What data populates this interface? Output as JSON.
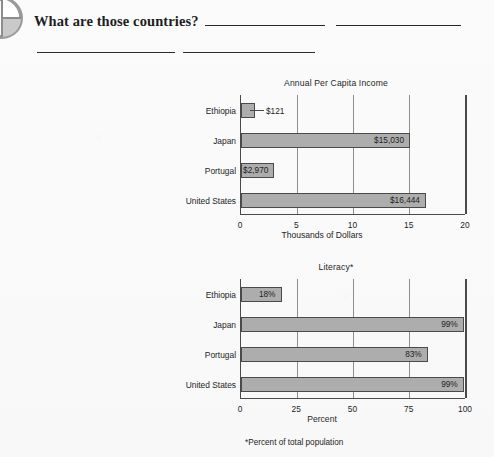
{
  "page": {
    "background_color": "#fafafa",
    "corner_icon": "pie-chart-icon"
  },
  "header": {
    "question": "What are those countries?",
    "answer_blanks": [
      "",
      "",
      "",
      ""
    ]
  },
  "charts": [
    {
      "title": "Annual Per Capita Income",
      "xlabel": "Thousands of Dollars",
      "footnote": ""
    },
    {
      "title": "Literacy*",
      "xlabel": "Percent",
      "footnote": "*Percent of total population"
    }
  ],
  "chart_data": [
    {
      "type": "bar",
      "orientation": "horizontal",
      "title": "Annual Per Capita Income",
      "xlabel": "Thousands of Dollars",
      "ylabel": "",
      "categories": [
        "Ethiopia",
        "Japan",
        "Portugal",
        "United States"
      ],
      "values": [
        0.121,
        15.03,
        2.97,
        16.444
      ],
      "value_labels": [
        "$121",
        "$15,030",
        "$2,970",
        "$16,444"
      ],
      "label_placement": [
        "outside",
        "inside",
        "inside",
        "inside"
      ],
      "xlim": [
        0,
        20
      ],
      "xticks": [
        0,
        5,
        10,
        15,
        20
      ],
      "xtick_labels": [
        "0",
        "5",
        "10",
        "15",
        "20"
      ],
      "grid": true,
      "legend": "none",
      "bar_color": "#adadad",
      "bar_edge_color": "#4a4a4a"
    },
    {
      "type": "bar",
      "orientation": "horizontal",
      "title": "Literacy*",
      "xlabel": "Percent",
      "ylabel": "",
      "categories": [
        "Ethiopia",
        "Japan",
        "Portugal",
        "United States"
      ],
      "values": [
        18,
        99,
        83,
        99
      ],
      "value_labels": [
        "18%",
        "99%",
        "83%",
        "99%"
      ],
      "label_placement": [
        "inside",
        "inside",
        "inside",
        "inside"
      ],
      "xlim": [
        0,
        100
      ],
      "xticks": [
        0,
        25,
        50,
        75,
        100
      ],
      "xtick_labels": [
        "0",
        "25",
        "50",
        "75",
        "100"
      ],
      "grid": true,
      "legend": "none",
      "annotation": "*Percent of total population",
      "bar_color": "#adadad",
      "bar_edge_color": "#4a4a4a"
    }
  ]
}
